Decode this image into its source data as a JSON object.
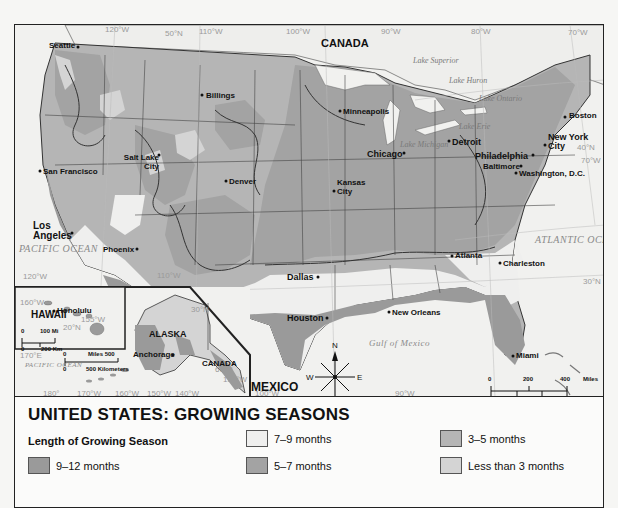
{
  "map": {
    "country_labels": [
      "CANADA",
      "MEXICO",
      "CANADA"
    ],
    "inset_labels": {
      "hawaii": "HAWAII",
      "alaska": "ALASKA"
    },
    "oceans": {
      "pacific": "PACIFIC OCEAN",
      "pacific_inset": "PACIFIC OCEAN",
      "atlantic": "ATLANTIC OCEAN",
      "gulf": "Gulf of Mexico"
    },
    "lakes": [
      "Lake Superior",
      "Lake Huron",
      "Lake Ontario",
      "Lake Erie",
      "Lake Michigan"
    ],
    "cities": [
      "Seattle",
      "Billings",
      "Minneapolis",
      "Boston",
      "New York City",
      "Detroit",
      "Chicago",
      "Philadelphia",
      "Baltimore",
      "Washington, D.C.",
      "Salt Lake City",
      "San Francisco",
      "Denver",
      "Kansas City",
      "Los Angeles",
      "Phoenix",
      "Dallas",
      "Atlanta",
      "Charleston",
      "Houston",
      "New Orleans",
      "Miami",
      "Honolulu",
      "Anchorage"
    ],
    "grid_labels": {
      "lon_120": "120°W",
      "lon_110": "110°W",
      "lon_100": "100°W",
      "lon_90": "90°W",
      "lon_80": "80°W",
      "lon_70": "70°W",
      "lat_50": "50°N",
      "lat_40": "40°N",
      "lat_30": "30°N",
      "hi_160": "160°W",
      "hi_155": "155°W",
      "hi_20": "20°N",
      "ak_170e": "170°E",
      "ak_180": "180°",
      "ak_170": "170°W",
      "ak_160": "160°W",
      "ak_150": "150°W",
      "ak_140": "140°W",
      "ak_60": "60°N",
      "ak_130": "130°W"
    },
    "compass": {
      "n": "N",
      "s": "S",
      "e": "E",
      "w": "W"
    },
    "scale_main": {
      "miles": [
        "0",
        "200",
        "400",
        "Miles"
      ],
      "km": [
        "0",
        "200",
        "400",
        "600",
        "Kilometers"
      ]
    },
    "scale_hawaii": {
      "miles": [
        "0",
        "100 Mi"
      ],
      "km": [
        "0",
        "200 Km"
      ]
    },
    "scale_alaska": {
      "miles": [
        "0",
        "Miles 500"
      ],
      "km": [
        "0",
        "500 Kilometers"
      ]
    }
  },
  "legend": {
    "title": "UNITED STATES: GROWING SEASONS",
    "subtitle": "Length of Growing Season",
    "items": [
      {
        "label": "9–12 months",
        "color": "#9a9a9a"
      },
      {
        "label": "7–9 months",
        "color": "#efefee"
      },
      {
        "label": "5–7 months",
        "color": "#a3a3a3"
      },
      {
        "label": "3–5 months",
        "color": "#b5b5b5"
      },
      {
        "label": "Less than 3 months",
        "color": "#d4d4d4"
      }
    ]
  },
  "colors": {
    "zone_9_12": "#9a9a9a",
    "zone_7_9": "#efefee",
    "zone_5_7": "#a3a3a3",
    "zone_3_5": "#b5b5b5",
    "zone_lt3": "#d4d4d4",
    "water": "#f1f1ef",
    "canada": "#eeeeec"
  }
}
